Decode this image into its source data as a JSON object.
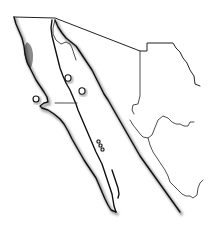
{
  "map": {
    "type": "outline-map",
    "region": "Northwestern Mexico (Baja California peninsula, Sonora, Sinaloa)",
    "background_color": "#ffffff",
    "line_color": "#111111",
    "highlight": {
      "name": "highlighted-range",
      "color": "#8a8a8a",
      "location": "Northwest Pacific coast of Baja California"
    },
    "labels": []
  }
}
